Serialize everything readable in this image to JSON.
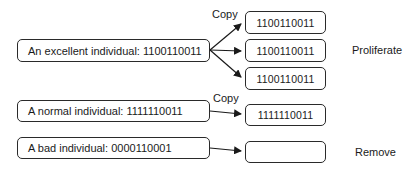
{
  "individuals": [
    {
      "label": "An excellent individual: 1100110011",
      "action_label": "Copy",
      "outcome": "Proliferate",
      "copies": [
        "1100110011",
        "1100110011",
        "1100110011"
      ]
    },
    {
      "label": "A normal individual: 1111110011",
      "action_label": "Copy",
      "outcome": "",
      "copies": [
        "1111110011"
      ]
    },
    {
      "label": "A bad individual: 0000110001",
      "action_label": "",
      "outcome": "Remove",
      "copies": [
        ""
      ]
    }
  ],
  "colors": {
    "stroke": "#2a2a2a",
    "background": "#ffffff"
  }
}
